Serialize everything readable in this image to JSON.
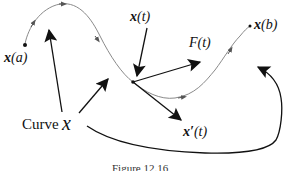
{
  "figure": {
    "caption": "Figure 12.16",
    "colors": {
      "curve": "#888888",
      "arrow": "#111111",
      "background": "#ffffff"
    },
    "labels": {
      "start_point": {
        "fn": "x",
        "arg": "(a)"
      },
      "current_point": {
        "fn": "x",
        "arg": "(t)"
      },
      "end_point": {
        "fn": "x",
        "arg": "(b)"
      },
      "force": {
        "fn": "F",
        "arg": "(t)"
      },
      "tangent": {
        "fn": "x′",
        "arg": "(t)"
      },
      "curve_word": "Curve",
      "curve_symbol": "x"
    }
  }
}
